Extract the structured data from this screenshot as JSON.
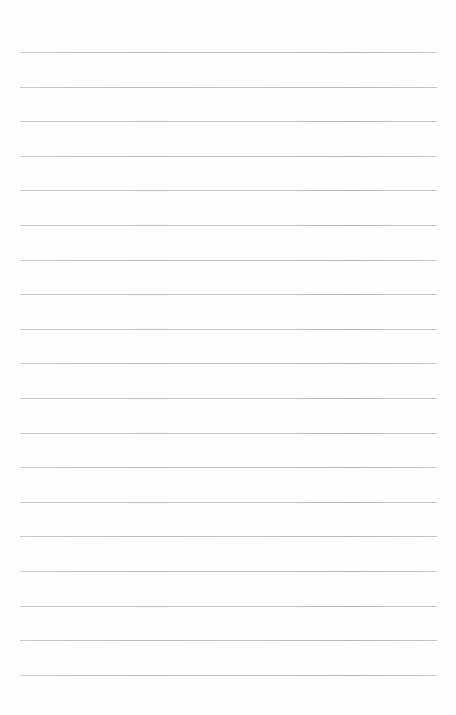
{
  "page": {
    "type": "blank ruled sheet",
    "background_color": "#fefefe",
    "rule_color": "#b8b8b8"
  },
  "rules": {
    "count": 19,
    "first_y": 52,
    "spacing": 34.6,
    "x_start": 20,
    "x_end": 437
  }
}
